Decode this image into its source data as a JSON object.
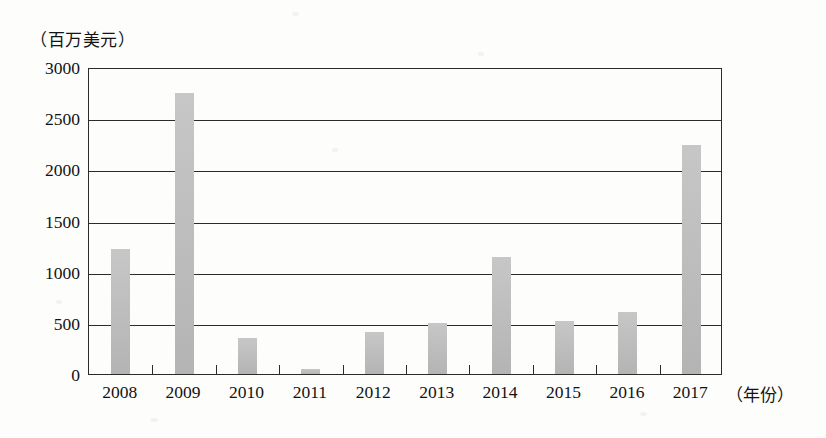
{
  "chart_data": {
    "type": "bar",
    "title": "",
    "subtitle": "",
    "xlabel": "（年份）",
    "ylabel": "（百万美元）",
    "categories": [
      "2008",
      "2009",
      "2010",
      "2011",
      "2012",
      "2013",
      "2014",
      "2015",
      "2016",
      "2017"
    ],
    "values": [
      1220,
      2750,
      350,
      50,
      410,
      500,
      1140,
      520,
      610,
      2240
    ],
    "ylim": [
      0,
      3000
    ],
    "y_ticks": [
      0,
      500,
      1000,
      1500,
      2000,
      2500,
      3000
    ],
    "y_tick_labels": [
      "0",
      "500",
      "1000",
      "1500",
      "2000",
      "2500",
      "3000"
    ],
    "grid": true,
    "grid_axis": "y",
    "legend": false,
    "legend_position": "none",
    "bar_color": "#bcbcbc",
    "axis_color": "#2b2b2b",
    "series": [
      {
        "name": "",
        "values": [
          1220,
          2750,
          350,
          50,
          410,
          500,
          1140,
          520,
          610,
          2240
        ]
      }
    ]
  },
  "axes": {
    "y_unit_caption": "（百万美元）",
    "x_unit_caption": "（年份）"
  }
}
